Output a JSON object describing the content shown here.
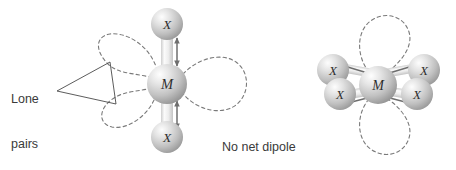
{
  "figure": {
    "background_color": "#ffffff",
    "width": 456,
    "height": 170,
    "labels": {
      "lone_pairs": "Lone\npairs",
      "lone_pairs_line1": "Lone",
      "lone_pairs_line2": "pairs",
      "no_net_dipole": "No net dipole"
    },
    "colors": {
      "text": "#3a3a3a",
      "lobe_stroke": "#7a7a7a",
      "leader_line": "#4a4a4a",
      "arrow": "#6e6e6e",
      "bond_light": "#f0f0f0",
      "bond_shade": "#c8c8c8",
      "sphere_light": "#f2f2f2",
      "sphere_mid": "#c9c9c9",
      "sphere_dark": "#9a9a9a",
      "atom_label": "#2e2e2e"
    },
    "structures": [
      {
        "id": "linear-mx2",
        "name": "linear-mx2-structure",
        "geometry": "linear",
        "center_atom": "M",
        "ligand_atom": "X",
        "ligand_count": 2,
        "lone_pair_count": 3,
        "atoms": [
          {
            "label": "X",
            "role": "ligand",
            "cx": 167,
            "cy": 24,
            "r": 16
          },
          {
            "label": "M",
            "role": "center",
            "cx": 167,
            "cy": 84,
            "r": 20
          },
          {
            "label": "X",
            "role": "ligand",
            "cx": 167,
            "cy": 137,
            "r": 16
          }
        ],
        "bond_dipoles": [
          {
            "direction": "up-down",
            "x": 176,
            "y1": 38,
            "y2": 66
          },
          {
            "direction": "up-down",
            "x": 176,
            "y1": 100,
            "y2": 128
          }
        ],
        "lone_pair_lobes": [
          {
            "position": "upper-left",
            "angle": 205
          },
          {
            "position": "lower-left",
            "angle": 160
          },
          {
            "position": "right",
            "angle": 0
          }
        ]
      },
      {
        "id": "square-planar-mx4",
        "name": "square-planar-mx4-structure",
        "geometry": "square planar",
        "center_atom": "M",
        "ligand_atom": "X",
        "ligand_count": 4,
        "lone_pair_count": 2,
        "atoms": [
          {
            "label": "X",
            "role": "ligand",
            "cx": 333,
            "cy": 70,
            "r": 16
          },
          {
            "label": "X",
            "role": "ligand",
            "cx": 340,
            "cy": 94,
            "r": 16
          },
          {
            "label": "M",
            "role": "center",
            "cx": 378,
            "cy": 85,
            "r": 19
          },
          {
            "label": "X",
            "role": "ligand",
            "cx": 424,
            "cy": 70,
            "r": 16
          },
          {
            "label": "X",
            "role": "ligand",
            "cx": 417,
            "cy": 94,
            "r": 16
          }
        ],
        "bond_dipoles": [
          {
            "direction": "toward-center",
            "from": "upper-left-x"
          },
          {
            "direction": "toward-center",
            "from": "lower-left-x"
          },
          {
            "direction": "toward-center",
            "from": "upper-right-x"
          },
          {
            "direction": "toward-center",
            "from": "lower-right-x"
          }
        ],
        "lone_pair_lobes": [
          {
            "position": "axial-top",
            "angle": 90
          },
          {
            "position": "axial-bottom",
            "angle": 270
          }
        ]
      }
    ]
  }
}
